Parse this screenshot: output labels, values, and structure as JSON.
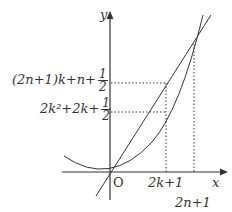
{
  "diagram": {
    "axes": {
      "x_label": "x",
      "y_label": "y",
      "origin_label": "O"
    },
    "y_labels": [
      {
        "main": "(2n+1)k+n+",
        "frac_num": "1",
        "frac_den": "2"
      },
      {
        "main": "2k²+2k+",
        "frac_num": "1",
        "frac_den": "2"
      }
    ],
    "x_labels": [
      {
        "text": "2k+1"
      },
      {
        "text": "2n+1"
      }
    ],
    "curves": [
      {
        "name": "parabola",
        "description": "parabola with vertex at origin"
      },
      {
        "name": "line",
        "description": "straight line through origin"
      }
    ],
    "colors": {
      "line": "#333333",
      "background": "#ffffff"
    }
  }
}
